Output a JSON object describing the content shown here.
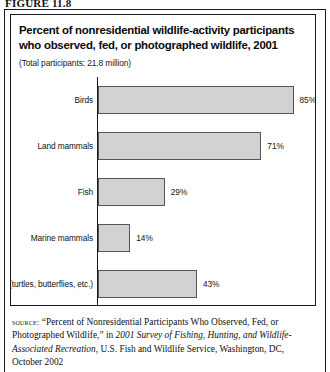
{
  "figure": {
    "number": "FIGURE 11.8"
  },
  "chart": {
    "title": "Percent of nonresidential wildlife-activity participants who observed, fed, or photographed wildlife, 2001",
    "subtitle": "(Total participants: 21.8 million)"
  },
  "chart_data": {
    "type": "bar",
    "orientation": "horizontal",
    "title": "Percent of nonresidential wildlife-activity participants who observed, fed, or photographed wildlife, 2001",
    "subtitle": "(Total participants: 21.8 million)",
    "categories": [
      "Birds",
      "Land mammals",
      "Fish",
      "Marine mammals",
      "Other (turtles, butterflies, etc.)"
    ],
    "values": [
      85,
      71,
      29,
      14,
      43
    ],
    "value_labels": [
      "85%",
      "71%",
      "29%",
      "14%",
      "43%"
    ],
    "xlabel": "",
    "ylabel": "",
    "xlim": [
      0,
      100
    ],
    "grid": false,
    "legend": false,
    "bar_fill": "#d2d2d2",
    "bar_stroke": "#555555"
  },
  "source": {
    "kicker": "source:",
    "part1": "“Percent of Nonresidential Participants Who Observed, Fed, or Photographed Wildlife,” in ",
    "italic1": "2001 Survey of Fishing, Hunting, and Wildlife-Associated Recreation",
    "part2": ", U.S. Fish and Wildlife Service, Washington, DC, October 2002"
  }
}
